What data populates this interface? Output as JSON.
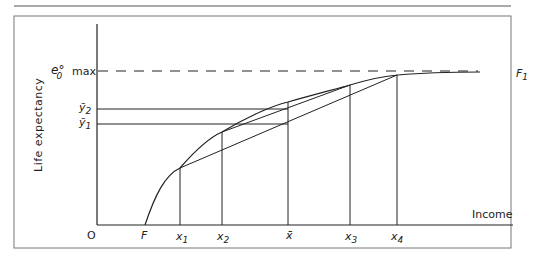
{
  "figure": {
    "y_axis_label": "Life expectancy",
    "x_axis_label": "Income",
    "max_label": "max",
    "e0_label": "e°",
    "e0_sub": "0",
    "y2_label": "ȳ",
    "y2_sub": "2",
    "y1_label": "ȳ",
    "y1_sub": "1",
    "origin_label": "O",
    "F_label": "F",
    "F1_label": "F",
    "F1_sub": "1",
    "x_ticks": [
      {
        "label": "x",
        "sub": "1"
      },
      {
        "label": "x",
        "sub": "2"
      },
      {
        "label": "x̄",
        "sub": ""
      },
      {
        "label": "x",
        "sub": "3"
      },
      {
        "label": "x",
        "sub": "4"
      }
    ]
  }
}
